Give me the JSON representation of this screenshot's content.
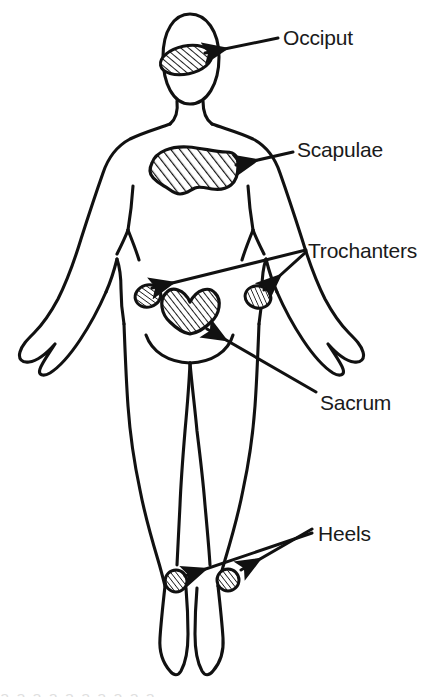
{
  "figure": {
    "orientation": "posterior view of a person lying supine",
    "background_color": "#ffffff",
    "ink_color": "#111111",
    "width": 446,
    "height": 697
  },
  "labels": {
    "occiput": "Occiput",
    "scapulae": "Scapulae",
    "trochanters": "Trochanters",
    "sacrum": "Sacrum",
    "heels": "Heels"
  },
  "pressure_points": [
    {
      "name": "occiput",
      "label": "Occiput",
      "shape": "hatched-ellipse",
      "count": 1,
      "body_region": "head",
      "label_position": {
        "x": 283,
        "y": 27
      },
      "marker_center": {
        "x": 186,
        "y": 60
      },
      "arrow_from": {
        "x": 278,
        "y": 38
      },
      "arrow_to": {
        "x": 205,
        "y": 53
      }
    },
    {
      "name": "scapulae",
      "label": "Scapulae",
      "shape": "hatched-blob",
      "count": 1,
      "body_region": "upper-back",
      "label_position": {
        "x": 297,
        "y": 139
      },
      "marker_center": {
        "x": 195,
        "y": 168
      },
      "arrow_from": {
        "x": 293,
        "y": 152
      },
      "arrow_to": {
        "x": 236,
        "y": 165
      }
    },
    {
      "name": "trochanters",
      "label": "Trochanters",
      "shape": "hatched-oval",
      "count": 2,
      "body_region": "hips",
      "label_position": {
        "x": 308,
        "y": 240
      },
      "marker_centers": [
        {
          "x": 148,
          "y": 296
        },
        {
          "x": 258,
          "y": 297
        }
      ],
      "arrow_from": {
        "x": 306,
        "y": 250
      },
      "arrow_to_left": {
        "x": 152,
        "y": 288
      },
      "arrow_to_right": {
        "x": 262,
        "y": 290
      }
    },
    {
      "name": "sacrum",
      "label": "Sacrum",
      "shape": "hatched-heart",
      "count": 1,
      "body_region": "lower-back",
      "label_position": {
        "x": 320,
        "y": 392
      },
      "marker_center": {
        "x": 197,
        "y": 312
      },
      "arrow_from": {
        "x": 316,
        "y": 392
      },
      "arrow_to": {
        "x": 206,
        "y": 330
      }
    },
    {
      "name": "heels",
      "label": "Heels",
      "shape": "hatched-circle",
      "count": 2,
      "body_region": "ankles",
      "label_position": {
        "x": 318,
        "y": 523
      },
      "marker_centers": [
        {
          "x": 176,
          "y": 581
        },
        {
          "x": 228,
          "y": 580
        }
      ],
      "arrow_from": {
        "x": 312,
        "y": 531
      },
      "arrow_to_left": {
        "x": 186,
        "y": 575
      },
      "arrow_to_right": {
        "x": 240,
        "y": 570
      }
    }
  ],
  "bottom_artifact": {
    "text": "a   a   a   a   a   a   a a a a",
    "visible": true
  }
}
